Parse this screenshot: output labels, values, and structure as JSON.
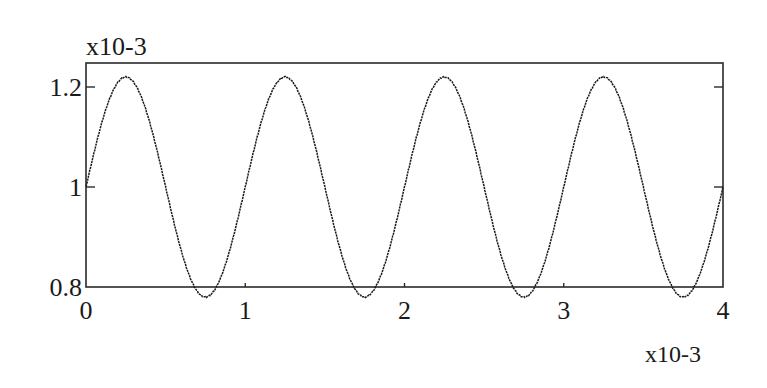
{
  "chart_data": {
    "type": "line",
    "title": "",
    "xlabel": "",
    "ylabel": "",
    "x_multiplier": "x10-3",
    "y_multiplier": "x10-3",
    "xlim": [
      0,
      4
    ],
    "ylim": [
      0.8,
      1.25
    ],
    "x_ticks": [
      0,
      1,
      2,
      3,
      4
    ],
    "x_tick_labels": [
      "0",
      "1",
      "2",
      "3",
      "4"
    ],
    "y_ticks": [
      0.8,
      1.0,
      1.2
    ],
    "y_tick_labels": [
      "0.8",
      "1",
      "1.2"
    ],
    "grid": false,
    "legend": null,
    "series": [
      {
        "name": "signal",
        "style": "dotted black line",
        "description": "sinusoid: 1 + 0.22*sin(2*pi*x), x in units of 1e-3, y in units of 1e-3",
        "x": [
          0,
          0.25,
          0.5,
          0.75,
          1.0,
          1.25,
          1.5,
          1.75,
          2.0,
          2.25,
          2.5,
          2.75,
          3.0,
          3.25,
          3.5,
          3.75,
          4.0
        ],
        "y": [
          1.0,
          1.22,
          1.0,
          0.82,
          1.0,
          1.22,
          1.0,
          0.82,
          1.0,
          1.22,
          1.0,
          0.82,
          1.0,
          1.22,
          1.0,
          0.82,
          0.99
        ]
      }
    ],
    "peaks_x": [
      0.25,
      1.25,
      2.25,
      3.25
    ],
    "troughs_x": [
      0.75,
      1.75,
      2.75,
      3.75
    ],
    "amplitude": 0.22,
    "mean": 1.0,
    "period": 1.0
  }
}
